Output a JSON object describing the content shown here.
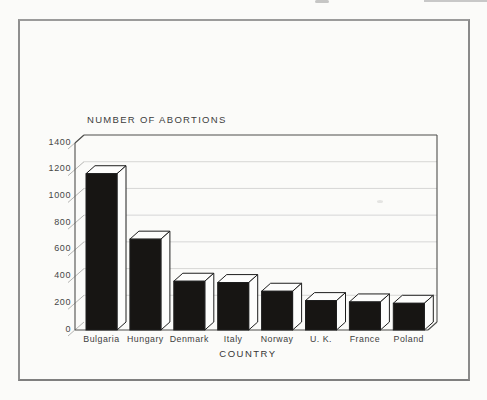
{
  "chart_data": {
    "type": "bar",
    "style": "3d-black-bars",
    "title": "NUMBER OF ABORTIONS",
    "xlabel": "COUNTRY",
    "ylabel": "",
    "categories": [
      "Bulgaria",
      "Hungary",
      "Denmark",
      "Italy",
      "Norway",
      "U. K.",
      "France",
      "Poland"
    ],
    "values": [
      1170,
      680,
      365,
      355,
      290,
      220,
      210,
      200
    ],
    "y_ticks": [
      0,
      200,
      400,
      600,
      800,
      1000,
      1200,
      1400
    ],
    "ylim": [
      0,
      1400
    ],
    "grid": true,
    "legend": "none",
    "colors": {
      "bar": "#171513",
      "outline": "#1e1e1e",
      "face": "#fdfdfc",
      "grid": "#d3d3d1",
      "tick": "#a2a2a0",
      "axis": "#4f4f4d",
      "text": "#3d3d3d"
    }
  }
}
